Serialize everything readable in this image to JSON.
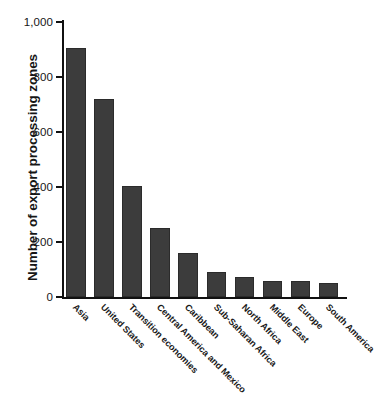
{
  "chart_data": {
    "type": "bar",
    "title": "",
    "xlabel": "",
    "ylabel": "Number of export processing zones",
    "ylim": [
      0,
      1000
    ],
    "yticks": [
      0,
      200,
      400,
      600,
      800,
      1000
    ],
    "ytick_labels": [
      "0",
      "200",
      "400",
      "600",
      "800",
      "1,000"
    ],
    "grid": false,
    "legend": "none",
    "bar_color": "#3c3c3c",
    "axis_color": "#111111",
    "categories": [
      "Asia",
      "United States",
      "Transition economies",
      "Central America and Mexico",
      "Caribbean",
      "Sub-Saharan Africa",
      "North Africa",
      "Middle East",
      "Europe",
      "South America"
    ],
    "values": [
      905,
      720,
      405,
      250,
      160,
      90,
      72,
      58,
      58,
      50
    ]
  }
}
